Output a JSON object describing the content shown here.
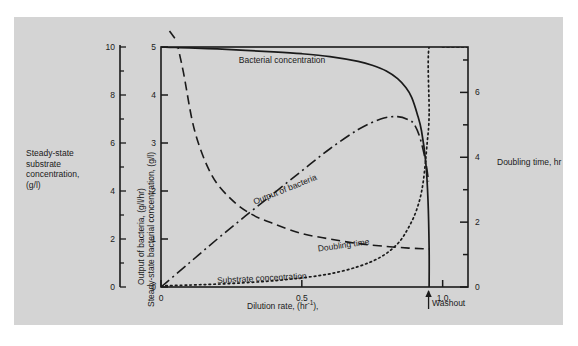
{
  "figure": {
    "background_color": "#d4d4d4",
    "page_color": "#ffffff",
    "line_color": "#1a1a1a"
  },
  "axes": {
    "left_outer": {
      "label_lines": [
        "Steady-state",
        "substrate",
        "concentration,",
        "(g/l)"
      ],
      "label_text": "Steady-state substrate concentration, (g/l)",
      "ticks": [
        "0",
        "2",
        "4",
        "6",
        "8",
        "10"
      ],
      "min": 0,
      "max": 10
    },
    "left_inner": {
      "label_line1": "Output of bacteria, (g/l/hr)",
      "label_line2": "Steady-state bacterial concentration, (g/l)",
      "ticks": [
        "0",
        "1",
        "2",
        "3",
        "4",
        "5"
      ],
      "min": 0,
      "max": 5
    },
    "right": {
      "label": "Doubling time, hr",
      "ticks": [
        "0",
        "2",
        "4",
        "6"
      ],
      "min": 0,
      "max": 7.4
    },
    "bottom": {
      "label": "Dilution rate, (hr",
      "label_exponent": "-1",
      "label_suffix": "),",
      "label_text": "Dilution rate, (hr-1)",
      "ticks": [
        "0",
        "0.5",
        "1.0"
      ],
      "min": 0,
      "max": 1.09
    }
  },
  "annotations": {
    "washout": "Washout"
  },
  "curve_labels": {
    "bacterial": "Bacterial concentration",
    "output": "Output of bacteria",
    "doubling": "Doubling time",
    "substrate": "Substrate concentration"
  },
  "chart_data": {
    "type": "line",
    "title": "",
    "xlabel": "Dilution rate, (hr-1)",
    "ylabel": "Output of bacteria, (g/l/hr) / Steady-state bacterial concentration, (g/l)",
    "ylabel_left": "Steady-state substrate concentration, (g/l)",
    "ylabel_right": "Doubling time, hr",
    "xlim": [
      0,
      1.09
    ],
    "ylim": [
      0,
      5
    ],
    "ylim_left": [
      0,
      10
    ],
    "ylim_right": [
      0,
      7.4
    ],
    "xticks": [
      0,
      0.5,
      1.0
    ],
    "yticks": [
      0,
      1,
      2,
      3,
      4,
      5
    ],
    "yticks_right": [
      0,
      2,
      4,
      6
    ],
    "grid": false,
    "legend": "inline-labels",
    "washout_dilution_rate": 0.95,
    "series": [
      {
        "name": "Bacterial concentration",
        "style": "solid",
        "axis": "left_inner",
        "x": [
          0.0,
          0.05,
          0.1,
          0.2,
          0.3,
          0.4,
          0.5,
          0.6,
          0.7,
          0.75,
          0.8,
          0.84,
          0.87,
          0.89,
          0.91,
          0.925,
          0.94,
          0.948,
          0.952,
          0.952
        ],
        "y": [
          5.0,
          4.99,
          4.98,
          4.96,
          4.93,
          4.9,
          4.86,
          4.8,
          4.7,
          4.62,
          4.5,
          4.34,
          4.15,
          3.95,
          3.6,
          3.25,
          2.6,
          1.8,
          0.8,
          0.0
        ]
      },
      {
        "name": "Output of bacteria",
        "style": "dashdot",
        "axis": "left_inner",
        "x": [
          0.0,
          0.1,
          0.2,
          0.3,
          0.4,
          0.5,
          0.6,
          0.7,
          0.78,
          0.84,
          0.88,
          0.9,
          0.92,
          0.94,
          0.95
        ],
        "y": [
          0.0,
          0.5,
          1.0,
          1.48,
          1.95,
          2.42,
          2.88,
          3.28,
          3.5,
          3.55,
          3.48,
          3.38,
          3.1,
          2.6,
          2.2
        ]
      },
      {
        "name": "Doubling time",
        "style": "dashed",
        "axis": "right",
        "x": [
          0.055,
          0.08,
          0.12,
          0.18,
          0.25,
          0.32,
          0.4,
          0.5,
          0.6,
          0.7,
          0.8,
          0.88,
          0.93,
          0.952
        ],
        "y": [
          7.6,
          6.6,
          4.8,
          3.45,
          2.7,
          2.25,
          1.95,
          1.65,
          1.48,
          1.34,
          1.25,
          1.2,
          1.18,
          1.17
        ]
      },
      {
        "name": "Substrate concentration",
        "style": "dotted",
        "axis": "left_outer",
        "x": [
          0.0,
          0.1,
          0.2,
          0.3,
          0.4,
          0.5,
          0.6,
          0.7,
          0.78,
          0.84,
          0.88,
          0.91,
          0.93,
          0.945,
          0.952,
          0.952,
          1.0,
          1.09
        ],
        "y": [
          0.05,
          0.08,
          0.12,
          0.18,
          0.26,
          0.38,
          0.55,
          0.85,
          1.25,
          1.8,
          2.5,
          3.3,
          4.3,
          6.0,
          7.2,
          10.0,
          10.0,
          10.0
        ]
      }
    ]
  }
}
